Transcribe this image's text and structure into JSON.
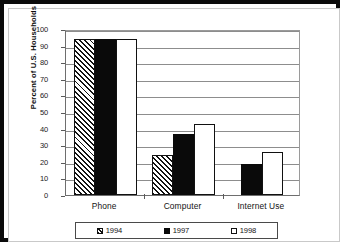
{
  "chart_data": {
    "type": "bar",
    "title": "",
    "xlabel": "",
    "ylabel": "Percent of U.S. Households",
    "ylim": [
      0,
      100
    ],
    "yticks": [
      0,
      10,
      20,
      30,
      40,
      50,
      60,
      70,
      80,
      90,
      100
    ],
    "grid": true,
    "legend_position": "bottom",
    "categories": [
      "Phone",
      "Computer",
      "Internet Use"
    ],
    "series": [
      {
        "name": "1994",
        "values": [
          94,
          24,
          null
        ]
      },
      {
        "name": "1997",
        "values": [
          94,
          37,
          18.5
        ]
      },
      {
        "name": "1998",
        "values": [
          94,
          42.5,
          26
        ]
      }
    ]
  },
  "legend": {
    "items": [
      {
        "label": "1994",
        "swatch": "hatched-square-icon"
      },
      {
        "label": "1997",
        "swatch": "filled-black-square-icon"
      },
      {
        "label": "1998",
        "swatch": "empty-white-square-icon"
      }
    ]
  },
  "colors": {
    "series_1994": "#ffffff",
    "series_1994_hatch": "#111111",
    "series_1997": "#0a0a0a",
    "series_1998": "#ffffff",
    "gridline": "#8d8d8d",
    "axis": "#6e6e6e",
    "frame": "#0b0b0b",
    "text": "#141414"
  }
}
